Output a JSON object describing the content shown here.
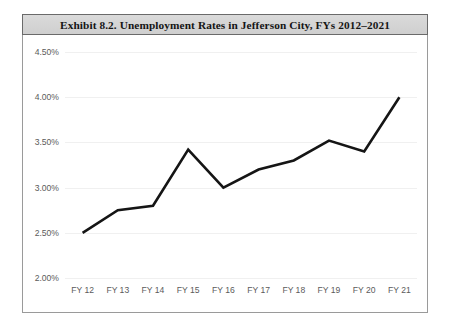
{
  "exhibit": {
    "title": "Exhibit 8.2.    Unemployment Rates in Jefferson City, FYs 2012–2021"
  },
  "axes": {
    "y_ticks": [
      "4.50%",
      "4.00%",
      "3.50%",
      "3.00%",
      "2.50%",
      "2.00%"
    ],
    "x_ticks": [
      "FY 12",
      "FY 13",
      "FY 14",
      "FY 15",
      "FY 16",
      "FY 17",
      "FY 18",
      "FY 19",
      "FY 20",
      "FY 21"
    ]
  },
  "style": {
    "line_color": "#151515",
    "gridline_color": "#f0f0f0",
    "banner_color": "#d4d4d4",
    "tick_text_color": "#5b5b5b",
    "frame_border_color": "#9a9a9a"
  },
  "chart_data": {
    "type": "line",
    "title": "Exhibit 8.2.    Unemployment Rates in Jefferson City, FYs 2012–2021",
    "xlabel": "",
    "ylabel": "",
    "categories": [
      "FY 12",
      "FY 13",
      "FY 14",
      "FY 15",
      "FY 16",
      "FY 17",
      "FY 18",
      "FY 19",
      "FY 20",
      "FY 21"
    ],
    "values": [
      2.5,
      2.75,
      2.8,
      3.42,
      3.0,
      3.2,
      3.3,
      3.52,
      3.4,
      4.0
    ],
    "value_labels": [
      "2.50%",
      "2.75%",
      "2.80%",
      "3.42%",
      "3.00%",
      "3.20%",
      "3.30%",
      "3.52%",
      "3.40%",
      "4.00%"
    ],
    "series": [
      {
        "name": "Unemployment Rate",
        "values": [
          2.5,
          2.75,
          2.8,
          3.42,
          3.0,
          3.2,
          3.3,
          3.52,
          3.4,
          4.0
        ]
      }
    ],
    "ylim": [
      2.0,
      4.5
    ],
    "y_ticks": [
      2.0,
      2.5,
      3.0,
      3.5,
      4.0,
      4.5
    ],
    "y_tick_labels": [
      "2.00%",
      "2.50%",
      "3.00%",
      "3.50%",
      "4.00%",
      "4.50%"
    ],
    "grid": true,
    "grid_axis": "y",
    "legend": false,
    "legend_position": "none",
    "markers": false
  }
}
